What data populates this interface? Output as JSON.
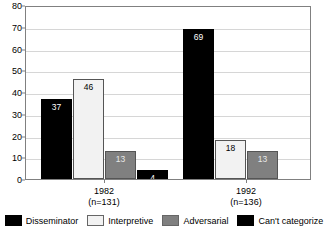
{
  "chart_data": {
    "type": "bar",
    "title": "",
    "subtitle": "",
    "xlabel": "",
    "ylabel": "",
    "ylim": [
      0,
      80
    ],
    "ytick_values": [
      0,
      10,
      20,
      30,
      40,
      50,
      60,
      70,
      80
    ],
    "ytick_labels": [
      "0",
      "10",
      "20",
      "30",
      "40",
      "50",
      "60",
      "70",
      "80"
    ],
    "grid": true,
    "grid_axis": "y",
    "legend_position": "bottom",
    "categories": [
      "1982",
      "1992"
    ],
    "category_sublabels": [
      "(n=131)",
      "(n=136)"
    ],
    "series": [
      {
        "name": "Disseminator",
        "values": [
          37,
          69
        ],
        "color": "#000000"
      },
      {
        "name": "Interpretive",
        "values": [
          46,
          18
        ],
        "color": "#f2f2f2"
      },
      {
        "name": "Adversarial",
        "values": [
          13,
          13
        ],
        "color": "#808080"
      },
      {
        "name": "Can't categorize",
        "values": [
          4,
          0
        ],
        "color": "#000000"
      }
    ],
    "bar_labels": [
      [
        "37",
        "46",
        "13",
        "4"
      ],
      [
        "69",
        "18",
        "13",
        ""
      ]
    ]
  },
  "axis": {
    "y_ticks": [
      {
        "label": "80",
        "value": 80
      },
      {
        "label": "70",
        "value": 70
      },
      {
        "label": "60",
        "value": 60
      },
      {
        "label": "50",
        "value": 50
      },
      {
        "label": "40",
        "value": 40
      },
      {
        "label": "30",
        "value": 30
      },
      {
        "label": "20",
        "value": 20
      },
      {
        "label": "10",
        "value": 10
      },
      {
        "label": "0",
        "value": 0
      }
    ]
  },
  "groups": [
    {
      "year": "1982",
      "n": "(n=131)"
    },
    {
      "year": "1992",
      "n": "(n=136)"
    }
  ],
  "legend": {
    "entries": [
      {
        "label": "Disseminator"
      },
      {
        "label": "Interpretive"
      },
      {
        "label": "Adversarial"
      },
      {
        "label": "Can't categorize"
      }
    ]
  }
}
